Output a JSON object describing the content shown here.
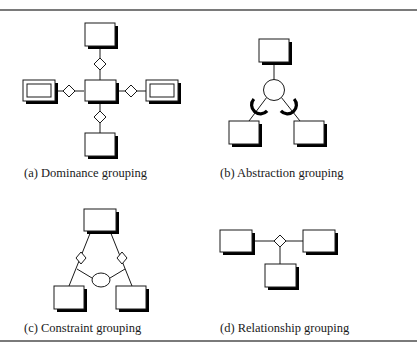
{
  "figure": {
    "panels": [
      {
        "id": "a",
        "caption": "(a) Dominance grouping",
        "elements": {
          "entities": [
            "top-entity",
            "center-entity",
            "bottom-entity"
          ],
          "weak_entities": [
            "left-double-entity",
            "right-double-entity"
          ],
          "relationships": 4
        }
      },
      {
        "id": "b",
        "caption": "(b) Abstraction grouping",
        "elements": {
          "entities": [
            "top-entity",
            "left-entity",
            "right-entity"
          ],
          "abstraction_circle": 1,
          "subset_arcs": 2
        }
      },
      {
        "id": "c",
        "caption": "(c) Constraint grouping",
        "elements": {
          "entities": [
            "top-entity",
            "left-entity",
            "right-entity"
          ],
          "relationships": 2,
          "constraint_ellipse": 1
        }
      },
      {
        "id": "d",
        "caption": "(d) Relationship grouping",
        "elements": {
          "entities": [
            "left-entity",
            "right-entity",
            "bottom-entity"
          ],
          "relationships": 1
        }
      }
    ],
    "colors": {
      "line": "#1a1a1a",
      "shadow": "#000000",
      "fill": "#ffffff",
      "rule": "#7a7a7a"
    }
  }
}
